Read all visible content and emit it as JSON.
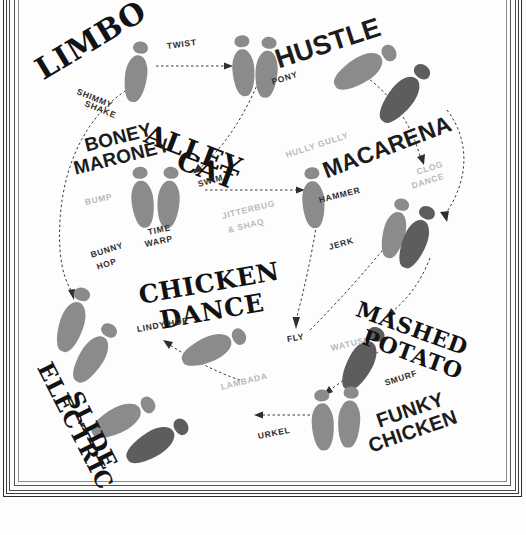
{
  "poster": {
    "kind": "dance-step-diagram",
    "background": "#fdfdfd",
    "footprint_color_light": "#8b8b8b",
    "footprint_color_dark": "#5d5d5d",
    "arrow_color": "#3a3a3a",
    "frame_color": "#2b2b2b"
  },
  "dance_titles": [
    {
      "text": "LIMBO",
      "style": "slab"
    },
    {
      "text": "HUSTLE",
      "style": "sans"
    },
    {
      "text": "ALLEY",
      "style": "slab"
    },
    {
      "text": "CAT",
      "style": "slab"
    },
    {
      "text": "BONEY",
      "style": "sans"
    },
    {
      "text": "MARONEY",
      "style": "sans"
    },
    {
      "text": "MACARENA",
      "style": "sans"
    },
    {
      "text": "CHICKEN",
      "style": "slab"
    },
    {
      "text": "DANCE",
      "style": "slab"
    },
    {
      "text": "MASHED",
      "style": "slab"
    },
    {
      "text": "POTATO",
      "style": "slab"
    },
    {
      "text": "ELECTRIC",
      "style": "slab"
    },
    {
      "text": "SLIDE",
      "style": "slab"
    },
    {
      "text": "FUNKY",
      "style": "sans"
    },
    {
      "text": "CHICKEN",
      "style": "sans"
    }
  ],
  "steps_dark": [
    {
      "text": "TWIST"
    },
    {
      "text": "PONY"
    },
    {
      "text": "SHIMMY"
    },
    {
      "text": "SHAKE"
    },
    {
      "text": "SWIM"
    },
    {
      "text": "HAMMER"
    },
    {
      "text": "TIME"
    },
    {
      "text": "WARP"
    },
    {
      "text": "BUNNY"
    },
    {
      "text": "HOP"
    },
    {
      "text": "JERK"
    },
    {
      "text": "FLY"
    },
    {
      "text": "LINDY HOP"
    },
    {
      "text": "SMURF"
    },
    {
      "text": "URKEL"
    }
  ],
  "steps_light": [
    {
      "text": "BUMP"
    },
    {
      "text": "HULLY GULLY"
    },
    {
      "text": "CLOG"
    },
    {
      "text": "DANCE"
    },
    {
      "text": "JITTERBUG"
    },
    {
      "text": "& SHAQ"
    },
    {
      "text": "WATUSI"
    },
    {
      "text": "LAMBADA"
    }
  ],
  "labels": {
    "limbo": "LIMBO",
    "hustle": "HUSTLE",
    "alley": "ALLEY",
    "cat": "CAT",
    "boney": "BONEY",
    "maroney": "MARONEY",
    "macarena": "MACARENA",
    "chicken": "CHICKEN",
    "dance": "DANCE",
    "mashed": "MASHED",
    "potato": "POTATO",
    "electric": "ELECTRIC",
    "slide": "SLIDE",
    "funky": "FUNKY",
    "funky_chicken": "CHICKEN",
    "twist": "TWIST",
    "pony": "PONY",
    "shimmy": "SHIMMY",
    "shake": "SHAKE",
    "swim": "SWIM",
    "hammer": "HAMMER",
    "time": "TIME",
    "warp": "WARP",
    "bunny": "BUNNY",
    "hop": "HOP",
    "jerk": "JERK",
    "fly": "FLY",
    "lindy_hop": "LINDY HOP",
    "smurf": "SMURF",
    "urkel": "URKEL",
    "bump": "BUMP",
    "hully_gully": "HULLY GULLY",
    "clog": "CLOG",
    "clog_dance": "DANCE",
    "jitterbug": "JITTERBUG",
    "and_shaq": "& SHAQ",
    "watusi": "WATUSI",
    "lambada": "LAMBADA"
  }
}
